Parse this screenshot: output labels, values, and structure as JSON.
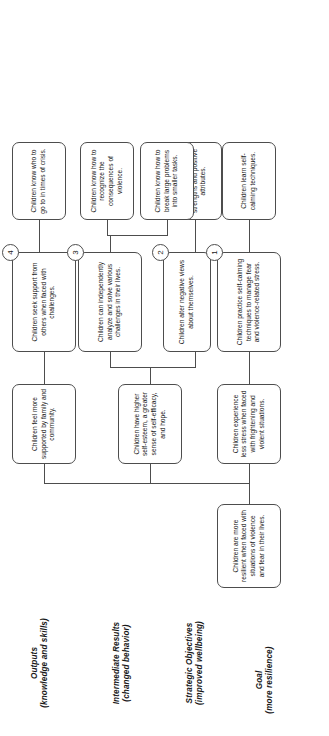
{
  "diagram": {
    "orientation": "rotated-90-ccw",
    "rows": [
      {
        "id": "goal",
        "label": "Goal",
        "sublabel": "(more resilience)"
      },
      {
        "id": "strategic",
        "label": "Strategic Objectives",
        "sublabel": "(improved wellbeing)"
      },
      {
        "id": "intermediate",
        "label": "Intermediate Results",
        "sublabel": "(changed behavior)"
      },
      {
        "id": "outputs",
        "label": "Outputs",
        "sublabel": "(knowledge and skills)"
      }
    ],
    "goal": {
      "text": "Children are more resilient when faced with situations of violence and fear in their lives."
    },
    "strategic_objectives": [
      {
        "id": "so1",
        "text": "Children experience less stress when faced with frightening and violent situations."
      },
      {
        "id": "so2",
        "text": "Children have higher self-esteem, a greater sense of self-efficacy, and hope."
      },
      {
        "id": "so3",
        "text": "Children feel more supported by family and community."
      }
    ],
    "intermediate_results": [
      {
        "id": "ir1",
        "badge": "1",
        "text": "Children practice self-calming techniques to manage fear and violence-related stress."
      },
      {
        "id": "ir2",
        "badge": "2",
        "text": "Children alter negative views about themselves."
      },
      {
        "id": "ir3",
        "badge": "3",
        "text": "Children can independently analyze and solve various challenges in their lives."
      },
      {
        "id": "ir4",
        "badge": "4",
        "text": "Children seek support from others when faced with challenges."
      }
    ],
    "outputs": [
      {
        "id": "op1",
        "text": "Children learn self-calming techniques."
      },
      {
        "id": "op2",
        "text": "Children identify their strengths and positive attributes."
      },
      {
        "id": "op3",
        "text": "Children know how to break large problems into smaller tasks."
      },
      {
        "id": "op4",
        "text": "Children know how to recognize the consequences of violence."
      },
      {
        "id": "op5",
        "text": "Children know who to go to in times of crisis."
      }
    ],
    "colors": {
      "stroke": "#4d4d4d",
      "text": "#1a1a1a",
      "background": "#ffffff"
    }
  }
}
